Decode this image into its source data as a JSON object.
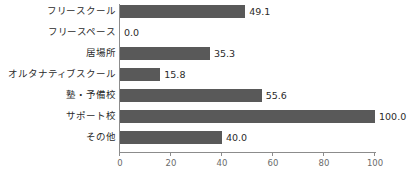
{
  "chart_data": {
    "type": "bar",
    "orientation": "horizontal",
    "title": "",
    "xlabel": "",
    "ylabel": "",
    "categories": [
      "フリースクール",
      "フリースペース",
      "居場所",
      "オルタナティブスクール",
      "塾・予備校",
      "サポート校",
      "その他"
    ],
    "values": [
      49.1,
      0.0,
      35.3,
      15.8,
      55.6,
      100.0,
      40.0
    ],
    "value_labels": [
      "49.1",
      "0.0",
      "35.3",
      "15.8",
      "55.6",
      "100.0",
      "40.0"
    ],
    "xlim": [
      0,
      100
    ],
    "xticks": [
      0,
      20,
      40,
      60,
      80,
      100
    ],
    "xtick_labels": [
      "0",
      "20",
      "40",
      "60",
      "80",
      "100"
    ],
    "grid": false,
    "legend": null,
    "bar_color": "#595959",
    "axis_color": "#8c8c8c",
    "text_color": "#2b2b2b"
  }
}
